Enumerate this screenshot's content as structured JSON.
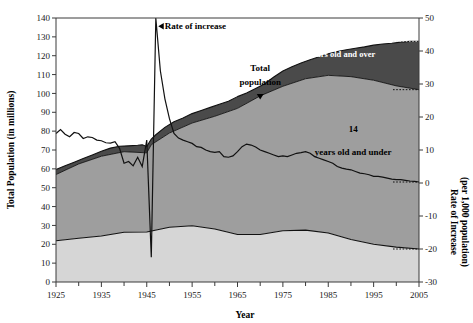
{
  "chart_data": {
    "type": "area",
    "title": "",
    "xlabel": "Year",
    "ylabel": "Total Population (in millions)",
    "ylabel_right_line1": "Rate of Increase",
    "ylabel_right_line2": "(per 1,000 population)",
    "xlim": [
      1925,
      2005
    ],
    "ylim": [
      0,
      140
    ],
    "ylim_right": [
      -30,
      50
    ],
    "grid": false,
    "legend_position": "inline-annotations",
    "x_ticks_major": [
      1925,
      1935,
      1945,
      1955,
      1965,
      1975,
      1985,
      1995,
      2005
    ],
    "x_ticks_minor": [
      1930,
      1940,
      1950,
      1960,
      1970,
      1980,
      1990,
      2000
    ],
    "y_ticks_left": [
      0,
      10,
      20,
      30,
      40,
      50,
      60,
      70,
      80,
      90,
      100,
      110,
      120,
      130,
      140
    ],
    "y_ticks_right": [
      -30,
      -20,
      -10,
      0,
      10,
      20,
      30,
      40,
      50
    ],
    "colors": {
      "band_65_over": "#4a4a4a",
      "band_middle": "#9e9e9e",
      "band_14_under": "#d6d6d6",
      "line": "#111111",
      "axis": "#3a3a3a",
      "background": "#ffffff"
    },
    "annotations": [
      {
        "name": "total-population",
        "text_line1": "Total",
        "text_line2": "population",
        "x": 1970,
        "y": 103,
        "style": "dark-with-arrow"
      },
      {
        "name": "rate-of-increase",
        "text": "Rate of increase",
        "x": 1950,
        "y": 47,
        "axis": "right",
        "style": "dark-with-arrow"
      },
      {
        "name": "age-65-over",
        "text_line1": "65",
        "text_line2": "years old and over",
        "x": 1988,
        "y": 124,
        "style": "white-inline"
      },
      {
        "name": "age-14-under",
        "text_line1": "14",
        "text_line2": "years old and under",
        "x": 1991,
        "y": 12,
        "axis": "right",
        "style": "dark-inline"
      }
    ],
    "series": [
      {
        "name": "Total population",
        "axis": "left",
        "units": "millions",
        "x": [
          1925,
          1927,
          1929,
          1931,
          1933,
          1935,
          1937,
          1939,
          1941,
          1943,
          1944,
          1945,
          1946,
          1947,
          1949,
          1951,
          1953,
          1955,
          1957,
          1959,
          1961,
          1963,
          1965,
          1967,
          1969,
          1971,
          1973,
          1975,
          1977,
          1979,
          1981,
          1983,
          1985,
          1987,
          1989,
          1991,
          1993,
          1995,
          1997,
          1999,
          2001,
          2003,
          2005
        ],
        "values": [
          59.7,
          61.6,
          63.5,
          65.5,
          67.4,
          69.3,
          71.0,
          72.0,
          72.2,
          72.5,
          72.8,
          71.9,
          75.8,
          78.1,
          82.0,
          85.0,
          87.0,
          89.3,
          90.9,
          92.6,
          94.3,
          95.9,
          98.3,
          100.2,
          102.6,
          105.1,
          108.7,
          111.9,
          114.2,
          116.1,
          117.9,
          119.5,
          121.0,
          122.2,
          123.2,
          124.0,
          124.7,
          125.6,
          126.2,
          126.6,
          127.2,
          127.6,
          127.7
        ]
      },
      {
        "name": "Under 65 (boundary: total minus 65-and-over)",
        "axis": "left",
        "units": "millions",
        "x": [
          1925,
          1930,
          1935,
          1940,
          1945,
          1946,
          1950,
          1955,
          1960,
          1965,
          1970,
          1975,
          1980,
          1985,
          1990,
          1995,
          2000,
          2005
        ],
        "values": [
          57.0,
          62.6,
          66.7,
          69.1,
          68.5,
          72.8,
          79.0,
          84.3,
          87.9,
          92.1,
          98.7,
          103.8,
          107.8,
          109.6,
          108.9,
          107.0,
          104.0,
          102.0
        ]
      },
      {
        "name": "14 years old and under",
        "axis": "left",
        "units": "millions",
        "x": [
          1925,
          1930,
          1935,
          1940,
          1945,
          1950,
          1955,
          1960,
          1965,
          1970,
          1975,
          1980,
          1985,
          1990,
          1995,
          2000,
          2005
        ],
        "values": [
          21.9,
          23.2,
          24.4,
          26.4,
          26.5,
          29.0,
          29.8,
          28.1,
          25.2,
          25.2,
          27.2,
          27.5,
          26.0,
          22.5,
          20.0,
          18.5,
          17.5
        ]
      },
      {
        "name": "Rate of increase",
        "axis": "right",
        "units": "per 1,000 population",
        "x": [
          1925,
          1926,
          1927,
          1928,
          1929,
          1930,
          1931,
          1932,
          1933,
          1934,
          1935,
          1936,
          1937,
          1938,
          1939,
          1940,
          1941,
          1942,
          1943,
          1944,
          1945,
          1946,
          1947,
          1948,
          1949,
          1950,
          1951,
          1952,
          1953,
          1954,
          1955,
          1956,
          1957,
          1958,
          1959,
          1960,
          1961,
          1962,
          1963,
          1964,
          1965,
          1966,
          1967,
          1968,
          1969,
          1970,
          1971,
          1972,
          1973,
          1974,
          1975,
          1976,
          1977,
          1978,
          1979,
          1980,
          1981,
          1982,
          1983,
          1984,
          1985,
          1986,
          1987,
          1988,
          1989,
          1990,
          1991,
          1992,
          1993,
          1994,
          1995,
          1996,
          1997,
          1998,
          1999,
          2000,
          2001,
          2002,
          2003,
          2004,
          2005
        ],
        "values": [
          15.0,
          16.2,
          14.8,
          14.0,
          15.3,
          15.0,
          13.5,
          14.0,
          13.8,
          13.0,
          12.8,
          12.2,
          12.1,
          12.5,
          10.5,
          6.0,
          6.5,
          5.2,
          7.8,
          5.0,
          13.0,
          -22.5,
          50.0,
          34.0,
          25.5,
          19.5,
          15.0,
          13.6,
          13.0,
          12.5,
          12.0,
          11.0,
          10.8,
          10.0,
          9.5,
          9.3,
          9.5,
          8.0,
          7.8,
          8.2,
          9.5,
          11.0,
          11.8,
          11.5,
          10.9,
          10.0,
          9.5,
          9.0,
          8.5,
          8.0,
          8.2,
          8.0,
          8.5,
          9.0,
          9.2,
          9.5,
          9.0,
          8.0,
          7.5,
          7.0,
          6.5,
          6.0,
          5.0,
          4.5,
          4.2,
          4.0,
          3.5,
          3.0,
          2.8,
          2.5,
          2.0,
          2.0,
          1.8,
          1.5,
          1.2,
          1.0,
          1.0,
          0.8,
          0.6,
          0.5,
          0.3
        ]
      }
    ],
    "projection_note": "dotted segments at right edge indicate projected values"
  },
  "axes": {
    "left_title": "Total Population (in millions)",
    "right_title_line1": "Rate of Increase",
    "right_title_line2": "(per 1,000 population)",
    "bottom_title": "Year"
  },
  "labels": {
    "total_population_l1": "Total",
    "total_population_l2": "population",
    "rate_of_increase": "Rate of increase",
    "age65_l1": "65",
    "age65_l2": "years old and over",
    "age14_l1": "14",
    "age14_l2": "years old and under"
  }
}
